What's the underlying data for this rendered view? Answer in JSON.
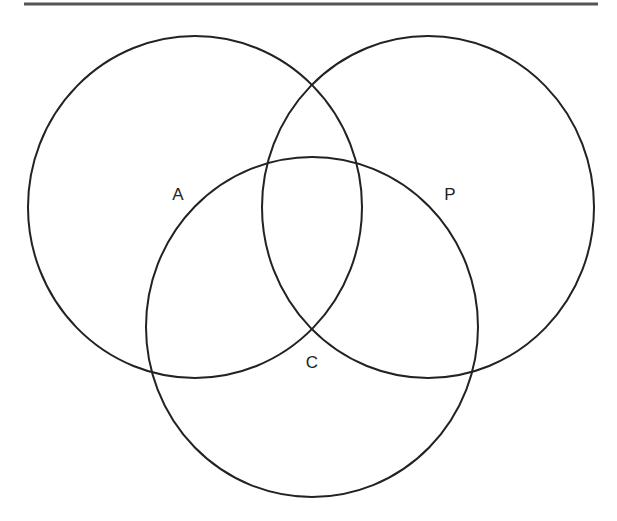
{
  "diagram": {
    "type": "venn",
    "sets": [
      {
        "id": "A",
        "label": "A",
        "cx": 195,
        "cy": 207,
        "rx": 167,
        "ry": 171,
        "label_x": 178,
        "label_y": 200
      },
      {
        "id": "P",
        "label": "P",
        "cx": 428,
        "cy": 207,
        "rx": 166,
        "ry": 171,
        "label_x": 450,
        "label_y": 200
      },
      {
        "id": "C",
        "label": "C",
        "cx": 312,
        "cy": 327,
        "rx": 166,
        "ry": 170,
        "label_x": 312,
        "label_y": 368
      }
    ],
    "top_rule": {
      "x1": 24,
      "x2": 598,
      "y": 4,
      "color": "#555555"
    },
    "stroke_color": "#222222",
    "background": "#ffffff"
  }
}
